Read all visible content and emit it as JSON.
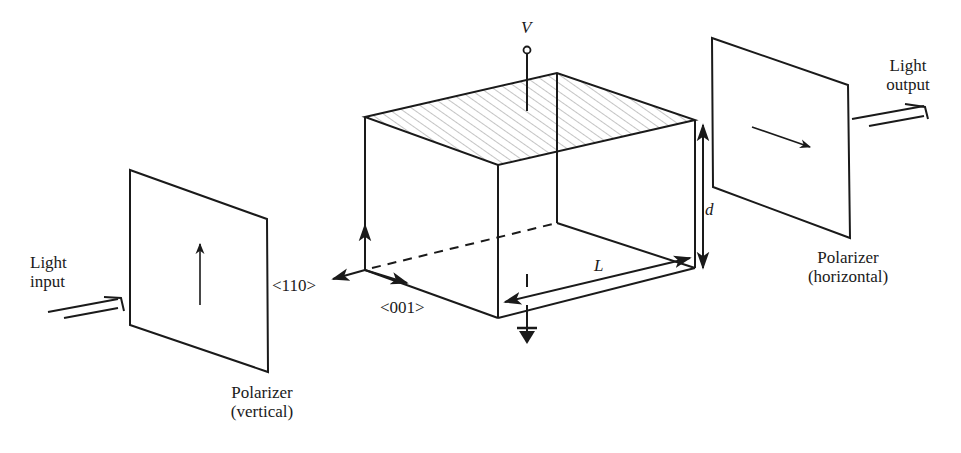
{
  "labels": {
    "light_input_line1": "Light",
    "light_input_line2": "input",
    "light_output_line1": "Light",
    "light_output_line2": "output",
    "polarizer_in_line1": "Polarizer",
    "polarizer_in_line2": "(vertical)",
    "polarizer_out_line1": "Polarizer",
    "polarizer_out_line2": "(horizontal)",
    "voltage": "V",
    "thickness": "d",
    "length": "L",
    "axis_110": "<110>",
    "axis_001": "<001>"
  },
  "components": [
    {
      "name": "input-polarizer",
      "orientation": "vertical"
    },
    {
      "name": "electro-optic-crystal",
      "top_electrode": "hatched",
      "terminal": "V",
      "bottom": "ground"
    },
    {
      "name": "output-polarizer",
      "orientation": "horizontal"
    }
  ],
  "colors": {
    "stroke": "#1a1a1a",
    "hatch": "#777777",
    "background": "#ffffff"
  }
}
